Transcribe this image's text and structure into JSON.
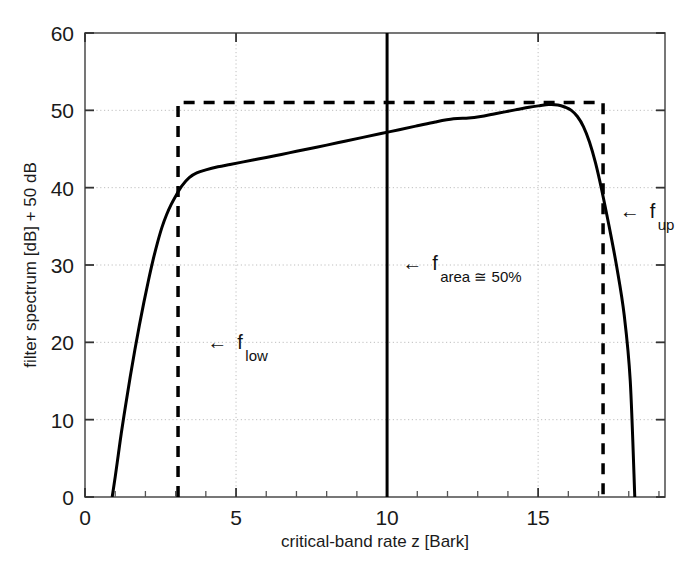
{
  "chart_data": {
    "type": "line",
    "title": "",
    "xlabel": "critical-band rate z [Bark]",
    "ylabel": "filter spectrum [dB] + 50 dB",
    "xlim": [
      0,
      19.2
    ],
    "ylim": [
      0,
      60
    ],
    "xticks": [
      0,
      5,
      10,
      15
    ],
    "xtick_labels": [
      "0",
      "5",
      "10",
      "15"
    ],
    "xminor_ticks": [
      1,
      2,
      3,
      4,
      6,
      7,
      8,
      9,
      11,
      12,
      13,
      14,
      16,
      17,
      18,
      19
    ],
    "yticks": [
      0,
      10,
      20,
      30,
      40,
      50,
      60
    ],
    "ytick_labels": [
      "0",
      "10",
      "20",
      "30",
      "40",
      "50",
      "60"
    ],
    "grid": true,
    "grid_style": "dotted",
    "series": [
      {
        "name": "filter spectrum",
        "style": "solid",
        "color": "#000000",
        "width": 3,
        "x": [
          0.9,
          1.0,
          1.1,
          1.2,
          1.35,
          1.5,
          1.65,
          1.8,
          1.95,
          2.1,
          2.25,
          2.4,
          2.55,
          2.7,
          2.85,
          3.0,
          3.2,
          3.45,
          3.7,
          4.0,
          4.4,
          4.8,
          5.2,
          5.6,
          6.0,
          6.5,
          7.0,
          7.5,
          8.0,
          8.6,
          9.2,
          9.8,
          10.4,
          11.0,
          11.6,
          12.2,
          12.7,
          13.1,
          13.5,
          13.9,
          14.3,
          14.7,
          15.05,
          15.35,
          15.65,
          15.9,
          16.1,
          16.3,
          16.5,
          16.7,
          16.9,
          17.1,
          17.35,
          17.6,
          17.85,
          18.05,
          18.2
        ],
        "y": [
          0.0,
          2.6,
          5.4,
          8.2,
          12.0,
          15.6,
          19.0,
          22.2,
          25.2,
          28.0,
          30.6,
          32.9,
          34.9,
          36.5,
          37.8,
          38.9,
          40.2,
          41.3,
          41.9,
          42.3,
          42.7,
          43.0,
          43.3,
          43.6,
          43.9,
          44.3,
          44.7,
          45.1,
          45.5,
          46.0,
          46.5,
          47.0,
          47.5,
          48.0,
          48.5,
          48.9,
          49.0,
          49.2,
          49.5,
          49.8,
          50.1,
          50.4,
          50.6,
          50.75,
          50.7,
          50.4,
          50.0,
          49.2,
          47.9,
          45.9,
          43.2,
          39.8,
          35.0,
          29.8,
          23.5,
          15.0,
          0.0
        ]
      },
      {
        "name": "ideal rectangular filter",
        "style": "dashed",
        "color": "#000000",
        "width": 3.5,
        "x": [
          3.08,
          3.08,
          17.15,
          17.15
        ],
        "y": [
          0.0,
          51.0,
          51.0,
          0.0
        ]
      },
      {
        "name": "f_area 50% line",
        "style": "solid",
        "color": "#000000",
        "width": 3,
        "x": [
          10.0,
          10.0
        ],
        "y": [
          0.0,
          60.0
        ]
      }
    ],
    "annotations": [
      {
        "id": "f_low",
        "base": "f",
        "sub": "low",
        "arrow": "←",
        "text": "← f_low",
        "x": 4.05,
        "y": 20.0
      },
      {
        "id": "f_area",
        "base": "f",
        "sub": "area ≅ 50%",
        "arrow": "←",
        "text": "← f_area ≅ 50%",
        "x": 10.5,
        "y": 30.2
      },
      {
        "id": "f_up",
        "base": "f",
        "sub": "up",
        "arrow": "←",
        "text": "← f_up",
        "x": 17.7,
        "y": 37.0
      }
    ]
  }
}
